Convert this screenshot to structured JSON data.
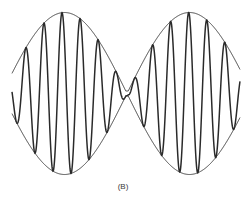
{
  "figure": {
    "caption": "(B)",
    "colors": {
      "line": "#2a2a2a",
      "background": "#ffffff"
    },
    "geometry": {
      "x_start": 12,
      "x_end": 240,
      "center_y": 93.5,
      "max_amplitude": 81,
      "min_amplitude": 2.5,
      "envelope_offset": 2,
      "envelope_half_period": 125,
      "carrier_period": 18.1,
      "carrier_peak_x": 62
    }
  }
}
